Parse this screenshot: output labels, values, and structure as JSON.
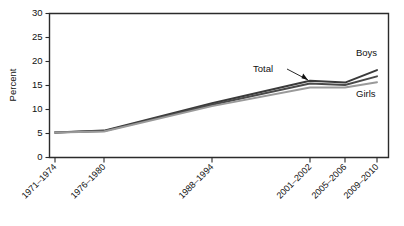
{
  "chart_data": {
    "type": "line",
    "title": "",
    "xlabel": "",
    "ylabel": "Percent",
    "ylim": [
      0,
      30
    ],
    "ytick_step": 5,
    "yticks": [
      "0",
      "5",
      "10",
      "15",
      "20",
      "25",
      "30"
    ],
    "grid": false,
    "legend_position": "inline-annotations",
    "categories": [
      "1971–1974",
      "1976–1980",
      "1988–1994",
      "2001–2002",
      "2005–2006",
      "2009–2010"
    ],
    "tick_labels": [
      "1971–1974",
      "1976–1980",
      "1988–1994",
      "2001–2002",
      "2005–2006",
      "2009–2010"
    ],
    "series": [
      {
        "name": "Boys",
        "color": "#3a3a3a",
        "label_text": "Boys",
        "values": [
          5.2,
          5.6,
          11.3,
          16.0,
          15.6,
          18.2
        ]
      },
      {
        "name": "Total",
        "color": "#4a4a4a",
        "label_text": "Total",
        "values": [
          5.2,
          5.5,
          11.0,
          15.4,
          15.1,
          16.9
        ]
      },
      {
        "name": "Girls",
        "color": "#9a9a9a",
        "label_text": "Girls",
        "values": [
          5.2,
          5.4,
          10.7,
          14.6,
          14.6,
          15.7
        ]
      }
    ],
    "annotations": [
      {
        "text": "Total",
        "series": "Total",
        "placement": "left-of-line"
      },
      {
        "text": "Boys",
        "series": "Boys",
        "placement": "upper-right"
      },
      {
        "text": "Girls",
        "series": "Girls",
        "placement": "lower-right"
      }
    ]
  }
}
